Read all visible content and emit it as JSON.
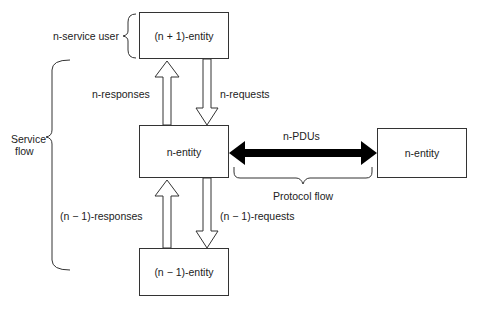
{
  "diagram": {
    "entities": {
      "upper": "(n + 1)-entity",
      "middle": "n-entity",
      "peer": "n-entity",
      "lower": "(n − 1)-entity"
    },
    "labels": {
      "service_user": "n-service user",
      "service_flow_line1": "Service",
      "service_flow_line2": "flow",
      "n_responses": "n-responses",
      "n_requests": "n-requests",
      "n_minus_1_responses": "(n − 1)-responses",
      "n_minus_1_requests": "(n − 1)-requests",
      "pdus": "n-PDUs",
      "protocol_flow": "Protocol flow"
    }
  }
}
